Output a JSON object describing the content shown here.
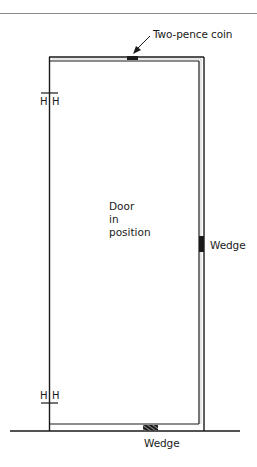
{
  "diagram": {
    "type": "door-fitting-illustration",
    "labels": {
      "coin": "Two-pence coin",
      "right_wedge": "Wedge",
      "bottom_wedge": "Wedge",
      "door_line1": "Door",
      "door_line2": "in",
      "door_line3": "position"
    },
    "hinges": {
      "upper": {
        "left": "H",
        "right": "H"
      },
      "lower": {
        "left": "H",
        "right": "H"
      }
    },
    "colors": {
      "line": "#1a1a1a",
      "rule": "#8c8c8c",
      "background": "#ffffff"
    }
  }
}
